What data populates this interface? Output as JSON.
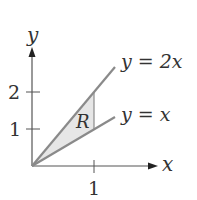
{
  "diagram": {
    "axes": {
      "x_label": "x",
      "y_label": "y",
      "x_ticks": [
        {
          "value": 1,
          "label": "1"
        }
      ],
      "y_ticks": [
        {
          "value": 1,
          "label": "1"
        },
        {
          "value": 2,
          "label": "2"
        }
      ]
    },
    "lines": [
      {
        "name": "y = 2x",
        "label": "y = 2x"
      },
      {
        "name": "y = x",
        "label": "y = x"
      }
    ],
    "region": {
      "label": "R",
      "bounds": "between y = x and y = 2x, for 0 ≤ x ≤ 1"
    },
    "colors": {
      "axis": "#555555",
      "line": "#8a8a8a",
      "region_fill": "#e6e6e6",
      "text": "#333333"
    }
  }
}
